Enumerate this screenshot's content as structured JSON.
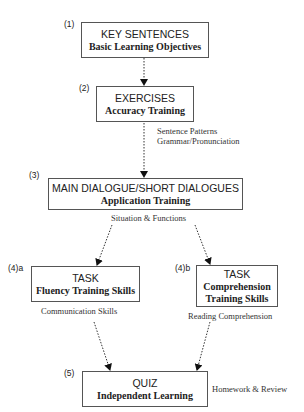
{
  "steps": [
    {
      "num": "(1)",
      "title": "KEY SENTENCES",
      "subtitle": "Basic Learning Objectives"
    },
    {
      "num": "(2)",
      "title": "EXERCISES",
      "subtitle": "Accuracy Training"
    },
    {
      "num": "(3)",
      "title": "MAIN DIALOGUE/SHORT DIALOGUES",
      "subtitle": "Application Training"
    },
    {
      "num": "(4)a",
      "title": "TASK",
      "subtitle": "Fluency Training Skills"
    },
    {
      "num": "(4)b",
      "title": "TASK",
      "subtitle_line1": "Comprehension",
      "subtitle_line2": "Training Skills"
    },
    {
      "num": "(5)",
      "title": "QUIZ",
      "subtitle": "Independent Learning"
    }
  ],
  "notes": {
    "exercises_line1": "Sentence Patterns",
    "exercises_line2": "Grammar/Pronunciation",
    "dialogue": "Situation & Functions",
    "fluency": "Communication Skills",
    "comprehension": "Reading Comprehension",
    "quiz": "Homework & Review"
  },
  "colors": {
    "line": "#333333",
    "border": "#555555",
    "text": "#222222"
  }
}
